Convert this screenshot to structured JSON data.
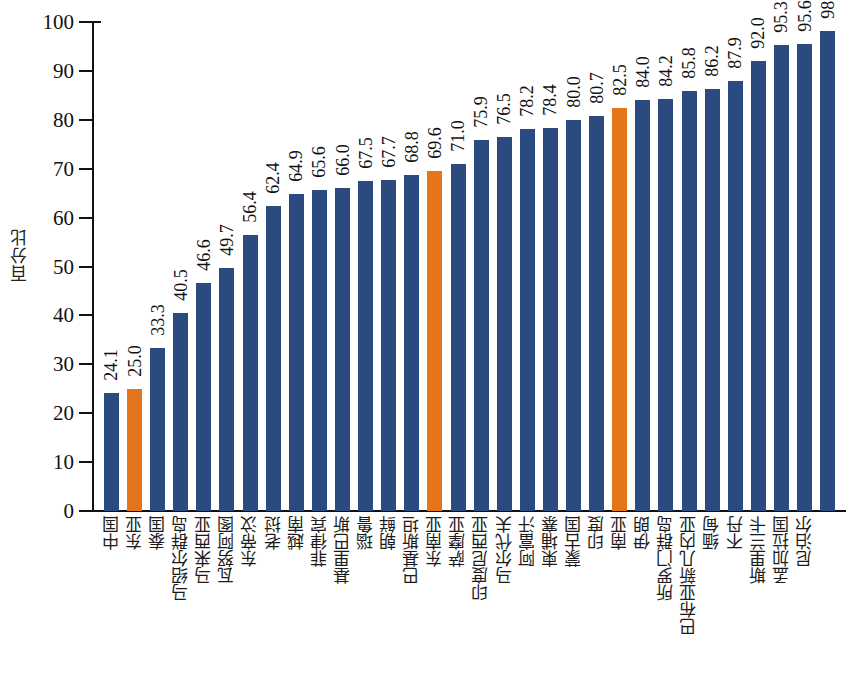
{
  "chart_data": {
    "type": "bar",
    "title": "",
    "xlabel": "",
    "ylabel": "百分比",
    "ylim": [
      0,
      100
    ],
    "ytick_labels": [
      "0",
      "10",
      "20",
      "30",
      "40",
      "50",
      "60",
      "70",
      "80",
      "90",
      "100"
    ],
    "yticks": [
      0,
      10,
      20,
      30,
      40,
      50,
      60,
      70,
      80,
      90,
      100
    ],
    "grid": false,
    "legend": null,
    "bar_color": "#2b4a80",
    "highlight_color": "#e5751b",
    "highlight_categories": [
      "东亚",
      "东南亚",
      "南亚"
    ],
    "categories": [
      "中国",
      "东亚",
      "泰国",
      "马绍尔群岛",
      "马来西亚",
      "瓦努阿图",
      "东帝汶",
      "老挝",
      "越南",
      "菲律宾",
      "基里巴斯",
      "瑙鲁",
      "朝鲜",
      "巴基斯坦",
      "东南亚",
      "萨摩亚",
      "印度尼西亚",
      "马尔代夫",
      "阿富汗",
      "柬埔寨",
      "蒙古国",
      "印度",
      "南亚",
      "伊朗",
      "所罗门群岛",
      "巴布亚新几内亚",
      "缅甸",
      "不丹",
      "斯里兰卡",
      "孟加拉国",
      "尼泊尔"
    ],
    "values": [
      24.1,
      25.0,
      33.3,
      40.5,
      46.6,
      49.7,
      56.4,
      62.4,
      64.9,
      65.6,
      66.0,
      67.5,
      67.7,
      68.8,
      69.6,
      71.0,
      75.9,
      76.5,
      78.2,
      78.4,
      80.0,
      80.7,
      82.5,
      84.0,
      84.2,
      85.8,
      86.2,
      87.9,
      92.0,
      95.3,
      95.6
    ],
    "value_labels": [
      "24.1",
      "25.0",
      "33.3",
      "40.5",
      "46.6",
      "49.7",
      "56.4",
      "62.4",
      "64.9",
      "65.6",
      "66.0",
      "67.5",
      "67.7",
      "68.8",
      "69.6",
      "71.0",
      "75.9",
      "76.5",
      "78.2",
      "78.4",
      "80.0",
      "80.7",
      "82.5",
      "84.0",
      "84.2",
      "85.8",
      "86.2",
      "87.9",
      "92.0",
      "95.3",
      "95.6"
    ]
  },
  "note_correction": {
    "description": "bar sequence as rendered left to right, category paired with value",
    "pairs": [
      {
        "category": "中国",
        "value": 24.1,
        "highlight": false
      },
      {
        "category": "东亚",
        "value": 25.0,
        "highlight": true
      },
      {
        "category": "泰国",
        "value": 33.3,
        "highlight": false
      },
      {
        "category": "马绍尔群岛",
        "value": 40.5,
        "highlight": false
      },
      {
        "category": "马来西亚",
        "value": 46.6,
        "highlight": false
      },
      {
        "category": "瓦努阿图",
        "value": 49.7,
        "highlight": false
      },
      {
        "category": "东帝汶",
        "value": 56.4,
        "highlight": false
      },
      {
        "category": "老挝",
        "value": 62.4,
        "highlight": false
      },
      {
        "category": "越南",
        "value": 64.9,
        "highlight": false
      },
      {
        "category": "菲律宾",
        "value": 65.6,
        "highlight": false
      },
      {
        "category": "基里巴斯",
        "value": 66.0,
        "highlight": false
      },
      {
        "category": "瑙鲁",
        "value": 67.5,
        "highlight": false
      },
      {
        "category": "朝鲜",
        "value": 67.7,
        "highlight": false
      },
      {
        "category": "巴基斯坦",
        "value": 68.8,
        "highlight": false
      },
      {
        "category": "东南亚",
        "value": 69.6,
        "highlight": false
      },
      {
        "category": "萨摩亚",
        "value": 71.0,
        "highlight": true
      },
      {
        "category": "印度尼西亚",
        "value": 75.9,
        "highlight": false
      },
      {
        "category": "马尔代夫",
        "value": 76.5,
        "highlight": false
      },
      {
        "category": "阿富汗",
        "value": 78.2,
        "highlight": false
      },
      {
        "category": "柬埔寨",
        "value": 78.4,
        "highlight": false
      },
      {
        "category": "蒙古国",
        "value": 80.0,
        "highlight": false
      },
      {
        "category": "印度",
        "value": 80.7,
        "highlight": false
      },
      {
        "category": "南亚",
        "value": 82.5,
        "highlight": false
      },
      {
        "category": "伊朗",
        "value": 84.0,
        "highlight": true
      },
      {
        "category": "所罗门群岛",
        "value": 84.2,
        "highlight": false
      },
      {
        "category": "巴布亚新几内亚",
        "value": 85.8,
        "highlight": false
      },
      {
        "category": "缅甸",
        "value": 86.2,
        "highlight": false
      },
      {
        "category": "不丹",
        "value": 87.9,
        "highlight": false
      },
      {
        "category": "斯里兰卡",
        "value": 92.0,
        "highlight": false
      },
      {
        "category": "孟加拉国",
        "value": 95.3,
        "highlight": false
      },
      {
        "category": "尼泊尔",
        "value": 95.6,
        "highlight": false
      }
    ]
  },
  "extra_bars": {
    "last_value_label": "98.1",
    "last_value": 98.1
  }
}
